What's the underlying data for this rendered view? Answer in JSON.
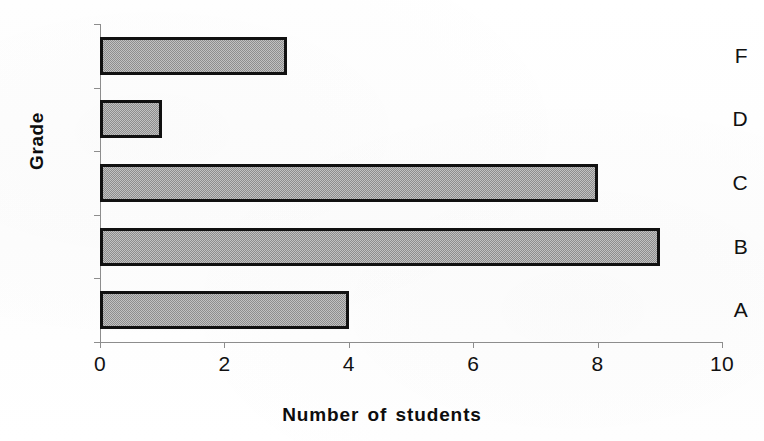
{
  "chart_data": {
    "type": "bar",
    "orientation": "horizontal",
    "title": "",
    "xlabel": "Number of students",
    "ylabel": "Grade",
    "categories": [
      "A",
      "B",
      "C",
      "D",
      "F"
    ],
    "values": [
      4,
      9,
      8,
      1,
      3
    ],
    "category_order_top_to_bottom": [
      "F",
      "D",
      "C",
      "B",
      "A"
    ],
    "xlim": [
      0,
      10
    ],
    "xticks": [
      0,
      2,
      4,
      6,
      8,
      10
    ],
    "xtick_labels": [
      "0",
      "2",
      "4",
      "6",
      "8",
      "10"
    ],
    "grid": false,
    "legend": false,
    "series": [
      {
        "name": "Number of students",
        "values": [
          4,
          9,
          8,
          1,
          3
        ]
      }
    ],
    "bar_fill": "#9c9c9c",
    "bar_border": "#111111",
    "axis_color": "#8d8d8d",
    "background": "#ffffff"
  },
  "axis_titles": {
    "x": "Number of students",
    "y": "Grade"
  },
  "y_categories": [
    {
      "label": "F",
      "value": 3
    },
    {
      "label": "D",
      "value": 1
    },
    {
      "label": "C",
      "value": 8
    },
    {
      "label": "B",
      "value": 9
    },
    {
      "label": "A",
      "value": 4
    }
  ],
  "x_ticks": [
    {
      "label": "0",
      "value": 0
    },
    {
      "label": "2",
      "value": 2
    },
    {
      "label": "4",
      "value": 4
    },
    {
      "label": "6",
      "value": 6
    },
    {
      "label": "8",
      "value": 8
    },
    {
      "label": "10",
      "value": 10
    }
  ]
}
